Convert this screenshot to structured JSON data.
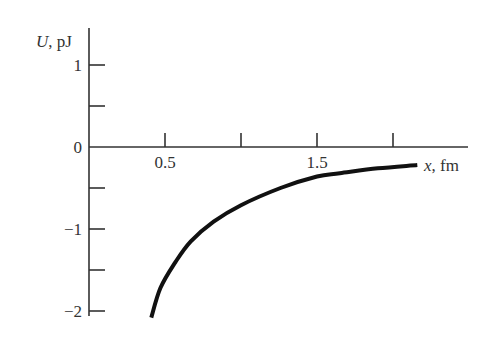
{
  "chart_data": {
    "type": "line",
    "title": "",
    "xlabel": "x, fm",
    "ylabel": "U, pJ",
    "xlabel_var": "x",
    "xlabel_unit": ", fm",
    "ylabel_var": "U",
    "ylabel_unit": ", pJ",
    "xlim": [
      0,
      2.5
    ],
    "ylim": [
      -2,
      1.2
    ],
    "x_ticks": [
      0.5,
      1.0,
      1.5,
      2.0
    ],
    "x_tick_labels": [
      "0.5",
      "1.5"
    ],
    "y_ticks": [
      1,
      0.5,
      0,
      -0.5,
      -1,
      -1.5,
      -2
    ],
    "y_tick_labels": [
      "1",
      "0",
      "−1",
      "−2"
    ],
    "grid": false,
    "legend": null,
    "series": [
      {
        "name": "U(x)",
        "x": [
          0.41,
          0.47,
          0.57,
          0.67,
          0.82,
          1.0,
          1.26,
          1.5,
          1.65,
          1.9,
          2.16
        ],
        "y": [
          -2.08,
          -1.72,
          -1.4,
          -1.15,
          -0.91,
          -0.71,
          -0.5,
          -0.36,
          -0.32,
          -0.26,
          -0.22
        ]
      }
    ]
  },
  "labels": {
    "y_var": "U",
    "y_unit": ", pJ",
    "x_var": "x",
    "x_unit": ", fm",
    "tick_y_1": "1",
    "tick_y_0": "0",
    "tick_y_m1": "−1",
    "tick_y_m2": "−2",
    "tick_x_05": "0.5",
    "tick_x_15": "1.5"
  }
}
